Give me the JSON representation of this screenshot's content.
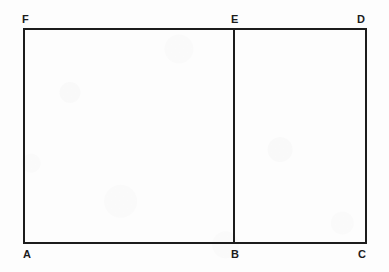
{
  "figure": {
    "background_color": "#fdfdfd",
    "stroke_color": "#1c1c1c",
    "stroke_width": 2,
    "outline": {
      "left_x": 24,
      "right_x": 366,
      "top_y": 29,
      "bottom_y": 243
    },
    "divider": {
      "name": "segment-BE",
      "x": 234,
      "top_y": 29,
      "bottom_y": 243
    },
    "vertices": [
      {
        "id": "F",
        "label": "F",
        "x": 24,
        "y": 29,
        "position": "top-left"
      },
      {
        "id": "E",
        "label": "E",
        "x": 234,
        "y": 29,
        "position": "top-middle"
      },
      {
        "id": "D",
        "label": "D",
        "x": 366,
        "y": 29,
        "position": "top-right"
      },
      {
        "id": "A",
        "label": "A",
        "x": 24,
        "y": 243,
        "position": "bottom-left"
      },
      {
        "id": "B",
        "label": "B",
        "x": 234,
        "y": 243,
        "position": "bottom-middle"
      },
      {
        "id": "C",
        "label": "C",
        "x": 366,
        "y": 243,
        "position": "bottom-right"
      }
    ],
    "edges": [
      {
        "name": "edge-FD",
        "from": "F",
        "to": "D"
      },
      {
        "name": "edge-DC",
        "from": "D",
        "to": "C"
      },
      {
        "name": "edge-CA",
        "from": "C",
        "to": "A"
      },
      {
        "name": "edge-AF",
        "from": "A",
        "to": "F"
      },
      {
        "name": "edge-EB",
        "from": "E",
        "to": "B"
      }
    ]
  }
}
